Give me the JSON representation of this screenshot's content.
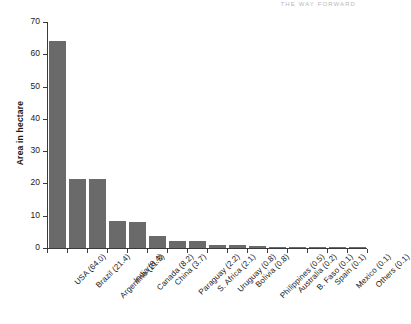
{
  "running_head": "THE WAY FORWARD",
  "chart_data": {
    "type": "bar",
    "title": "",
    "xlabel": "",
    "ylabel": "Area in hectare",
    "ylim": [
      0,
      70
    ],
    "ytick_step": 10,
    "yticks": [
      "0",
      "10",
      "20",
      "30",
      "40",
      "50",
      "60",
      "70"
    ],
    "grid": false,
    "legend": false,
    "bar_color": "#6a6a6a",
    "axis_color": "#3a3a3a",
    "orientation": "vertical",
    "categories": [
      "USA (64.0)",
      "Brazil (21.4)",
      "Argentina (21.3)",
      "India (8.4)",
      "Canada (8.2)",
      "China (3.7)",
      "Paraguay (2.2)",
      "S. Africa (2.1)",
      "Uruguay (0.8)",
      "Bolivia (0.8)",
      "Philippines (0.5)",
      "Australia (0.2)",
      "B. Faso (0.1)",
      "Spain (0.1)",
      "Mexico (0.1)",
      "Others (0.1)"
    ],
    "country_names": [
      "USA",
      "Brazil",
      "Argentina",
      "India",
      "Canada",
      "China",
      "Paraguay",
      "S. Africa",
      "Uruguay",
      "Bolivia",
      "Philippines",
      "Australia",
      "B. Faso",
      "Spain",
      "Mexico",
      "Others"
    ],
    "values": [
      64.0,
      21.4,
      21.3,
      8.4,
      8.2,
      3.7,
      2.2,
      2.1,
      0.8,
      0.8,
      0.5,
      0.2,
      0.1,
      0.1,
      0.1,
      0.1
    ]
  }
}
